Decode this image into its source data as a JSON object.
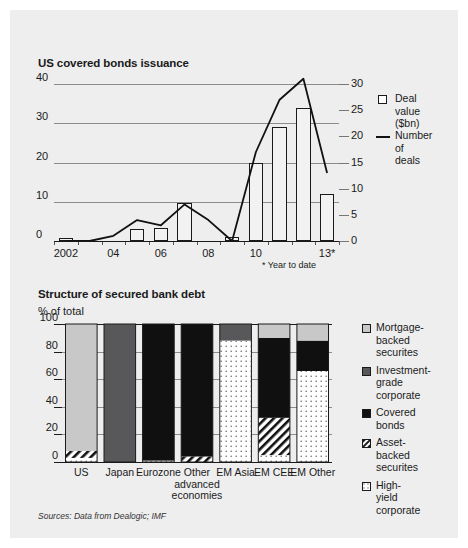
{
  "chart_data": [
    {
      "type": "bar",
      "title": "US covered bonds issuance",
      "xlabel": "",
      "ylabel": "",
      "ylim": [
        0,
        40
      ],
      "y2lim": [
        0,
        30
      ],
      "grid": true,
      "legend_position": "right",
      "footnote": "* Year to date",
      "x": [
        "2002",
        "03",
        "04",
        "05",
        "06",
        "07",
        "08",
        "09",
        "10",
        "11",
        "12",
        "13*"
      ],
      "xtick_labels": [
        "2002",
        "04",
        "06",
        "08",
        "10",
        "13*"
      ],
      "ytick_labels": [
        "0",
        "10",
        "20",
        "30",
        "40"
      ],
      "y2tick_labels": [
        "0",
        "5",
        "10",
        "15",
        "20",
        "25",
        "30"
      ],
      "series": [
        {
          "name": "Deal value ($bn)",
          "type": "bar",
          "axis": "left",
          "values": [
            0.8,
            0.0,
            0.0,
            3.0,
            3.2,
            9.8,
            0.0,
            1.0,
            20.0,
            29.0,
            34.0,
            12.0
          ]
        },
        {
          "name": "Number of deals",
          "type": "line",
          "axis": "right",
          "values": [
            0,
            0,
            1,
            4,
            3,
            7,
            4,
            0,
            17,
            27,
            31,
            13
          ]
        }
      ]
    },
    {
      "type": "bar",
      "title": "Structure of secured bank debt",
      "subtitle": "% of total",
      "xlabel": "",
      "ylabel": "",
      "ylim": [
        0,
        100
      ],
      "grid": true,
      "stacked": true,
      "legend_position": "right",
      "categories": [
        "US",
        "Japan",
        "Eurozone",
        "Other advanced economies",
        "EM Asia",
        "EM CEE",
        "EM Other"
      ],
      "ytick_labels": [
        "0",
        "20",
        "40",
        "60",
        "80",
        "100"
      ],
      "series": [
        {
          "name": "Mortgage-backed securites",
          "fill": "light-gray",
          "values": [
            92,
            0,
            0,
            0,
            0,
            10,
            12
          ]
        },
        {
          "name": "Investment-grade corporate",
          "fill": "dark-gray",
          "values": [
            0,
            100,
            0,
            0,
            12,
            0,
            0
          ]
        },
        {
          "name": "Covered bonds",
          "fill": "black",
          "values": [
            0,
            0,
            99,
            96,
            0,
            58,
            22
          ]
        },
        {
          "name": "Asset-backed securites",
          "fill": "hatched",
          "values": [
            5,
            0,
            0,
            4,
            0,
            27,
            0
          ]
        },
        {
          "name": "High-yield corporate",
          "fill": "dotted-white",
          "values": [
            3,
            0,
            1,
            0,
            88,
            5,
            66
          ]
        }
      ]
    }
  ],
  "chart1": {
    "title": "US covered bonds issuance",
    "footnote": "* Year to date",
    "y_ticks": [
      {
        "label": "40",
        "value": 40
      },
      {
        "label": "30",
        "value": 30
      },
      {
        "label": "20",
        "value": 20
      },
      {
        "label": "10",
        "value": 10
      },
      {
        "label": "0",
        "value": 0
      }
    ],
    "y2_ticks": [
      {
        "label": "30",
        "value": 30
      },
      {
        "label": "25",
        "value": 25
      },
      {
        "label": "20",
        "value": 20
      },
      {
        "label": "15",
        "value": 15
      },
      {
        "label": "10",
        "value": 10
      },
      {
        "label": "5",
        "value": 5
      },
      {
        "label": "0",
        "value": 0
      }
    ],
    "x_ticks": [
      {
        "label": "2002",
        "index": 0
      },
      {
        "label": "04",
        "index": 2
      },
      {
        "label": "06",
        "index": 4
      },
      {
        "label": "08",
        "index": 6
      },
      {
        "label": "10",
        "index": 8
      },
      {
        "label": "13*",
        "index": 11
      }
    ],
    "legend": [
      {
        "label": "Deal value\n($bn)",
        "marker": "square-open"
      },
      {
        "label": "Number of\ndeals",
        "marker": "line"
      }
    ]
  },
  "chart2": {
    "title": "Structure of secured bank debt",
    "subtitle": "% of total",
    "y_ticks": [
      {
        "label": "100",
        "value": 100
      },
      {
        "label": "80",
        "value": 80
      },
      {
        "label": "60",
        "value": 60
      },
      {
        "label": "40",
        "value": 40
      },
      {
        "label": "20",
        "value": 20
      },
      {
        "label": "0",
        "value": 0
      }
    ],
    "categories": [
      {
        "label": "US"
      },
      {
        "label": "Japan"
      },
      {
        "label": "Eurozone"
      },
      {
        "label": "Other\nadvanced\neconomies"
      },
      {
        "label": "EM\nAsia"
      },
      {
        "label": "EM\nCEE"
      },
      {
        "label": "EM\nOther"
      }
    ],
    "legend": [
      {
        "label": "Mortgage-\nbacked\nsecurites",
        "fill": "light-gray"
      },
      {
        "label": "Investment-\ngrade\ncorporate",
        "fill": "dark-gray"
      },
      {
        "label": "Covered\nbonds",
        "fill": "black"
      },
      {
        "label": "Asset-\nbacked\nsecurites",
        "fill": "hatched"
      },
      {
        "label": "High-yield\ncorporate",
        "fill": "dotted-white"
      }
    ]
  },
  "source": "Sources: Data from Dealogic; IMF",
  "colors": {
    "background": "#eeeeee",
    "light_gray": "#c8c8c8",
    "dark_gray": "#58585a",
    "black": "#101010",
    "white": "#fdfdfd",
    "grid": "#8c8c8c",
    "axis": "#1a1a1a"
  }
}
